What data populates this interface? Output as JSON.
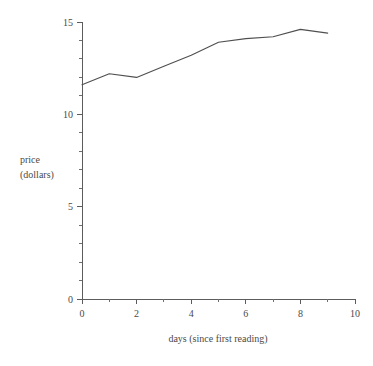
{
  "chart_data": {
    "type": "line",
    "title": "",
    "subtitle": "",
    "xlabel": "days (since first reading)",
    "ylabel_line1": "price",
    "ylabel_line2": "(dollars)",
    "ylabel": "price (dollars)",
    "xlim": [
      0,
      10
    ],
    "ylim": [
      0,
      15
    ],
    "grid": false,
    "legend": false,
    "legend_position": "none",
    "x_major_ticks": [
      0,
      2,
      4,
      6,
      8,
      10
    ],
    "x_major_tick_labels": [
      "0",
      "2",
      "4",
      "6",
      "8",
      "10"
    ],
    "x_minor_ticks": [
      1,
      3,
      5,
      7,
      9
    ],
    "y_major_ticks": [
      0,
      5,
      10,
      15
    ],
    "y_major_tick_labels": [
      "0",
      "5",
      "10",
      "15"
    ],
    "y_minor_ticks": [
      1,
      2,
      3,
      4,
      6,
      7,
      8,
      9,
      11,
      12,
      13,
      14
    ],
    "x": [
      0,
      1,
      2,
      3,
      4,
      5,
      6,
      7,
      8,
      9
    ],
    "values": [
      11.6,
      12.2,
      12.0,
      12.6,
      13.2,
      13.9,
      14.1,
      14.2,
      14.6,
      14.4
    ],
    "series": [
      {
        "name": "price",
        "color": "#4f4f4f",
        "x": [
          0,
          1,
          2,
          3,
          4,
          5,
          6,
          7,
          8,
          9
        ],
        "values": [
          11.6,
          12.2,
          12.0,
          12.6,
          13.2,
          13.9,
          14.1,
          14.2,
          14.6,
          14.4
        ]
      }
    ],
    "annotations": []
  },
  "colors": {
    "background": "#ffffff",
    "axis": "#5c5c5c",
    "text": "#4a4a4a",
    "line": "#4f4f4f"
  }
}
